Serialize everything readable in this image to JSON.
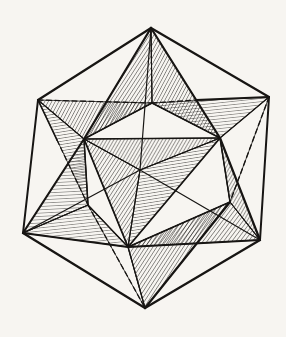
{
  "figure": {
    "name": "stella-octangula-in-cube",
    "canvas": {
      "width": 286,
      "height": 337,
      "background": "#f7f5f1",
      "ink": "#171513"
    },
    "points": {
      "T": [
        151,
        28
      ],
      "UL": [
        38,
        100
      ],
      "UR": [
        269,
        97
      ],
      "L": [
        23,
        233
      ],
      "R": [
        260,
        240
      ],
      "B": [
        145,
        308
      ],
      "F": [
        140,
        170
      ],
      "OT": [
        152,
        103
      ],
      "ONW": [
        84,
        139
      ],
      "ONE": [
        220,
        138
      ],
      "OSW": [
        88,
        205
      ],
      "OSE": [
        230,
        202
      ],
      "OS": [
        128,
        247
      ],
      "RT1": [
        196,
        100
      ],
      "RS1": [
        57,
        140
      ]
    },
    "hatches": [
      {
        "id": "steepA",
        "angle": -57,
        "gap": 3.2,
        "stroke": 0.85
      },
      {
        "id": "steepB",
        "angle": -62,
        "gap": 3.1,
        "stroke": 0.85
      },
      {
        "id": "steepC",
        "angle": -53,
        "gap": 3.3,
        "stroke": 0.85
      },
      {
        "id": "steepD",
        "angle": -60,
        "gap": 3.0,
        "stroke": 0.85
      },
      {
        "id": "horizA",
        "angle": -6,
        "gap": 3.2,
        "stroke": 0.8
      },
      {
        "id": "horizB",
        "angle": -9,
        "gap": 3.1,
        "stroke": 0.8
      },
      {
        "id": "horizC",
        "angle": -3,
        "gap": 3.3,
        "stroke": 0.8
      }
    ],
    "facets": [
      {
        "name": "star-point-ul-upper-face",
        "pts": [
          "UL",
          "OT",
          "ONW"
        ],
        "fill": "steepB"
      },
      {
        "name": "star-point-ul-lower-face",
        "pts": [
          "UL",
          "ONW",
          "OSW"
        ],
        "fill": "horizB"
      },
      {
        "name": "star-point-ur-upper-face",
        "pts": [
          "UR",
          "OT",
          "ONE"
        ],
        "fill": "horizA"
      },
      {
        "name": "star-point-ur-lower-face",
        "pts": [
          "UR",
          "ONE",
          "OSE"
        ],
        "fill": "white"
      },
      {
        "name": "star-point-b-left-face",
        "pts": [
          "B",
          "OSW",
          "OS"
        ],
        "fill": "white"
      },
      {
        "name": "star-point-b-right-face",
        "pts": [
          "B",
          "OS",
          "OSE"
        ],
        "fill": "steepA"
      },
      {
        "name": "star-point-t-left-face",
        "pts": [
          "T",
          "ONW",
          "OT"
        ],
        "fill": "steepA"
      },
      {
        "name": "star-point-t-right-face",
        "pts": [
          "T",
          "OT",
          "ONE"
        ],
        "fill": "steepB"
      },
      {
        "name": "star-point-l-upper-face",
        "pts": [
          "L",
          "ONW",
          "OSW"
        ],
        "fill": "horizC"
      },
      {
        "name": "star-point-l-lower-face",
        "pts": [
          "L",
          "OSW",
          "OS"
        ],
        "fill": "horizA"
      },
      {
        "name": "star-point-r-upper-face",
        "pts": [
          "R",
          "ONE",
          "OSE"
        ],
        "fill": "steepD"
      },
      {
        "name": "star-point-r-lower-face",
        "pts": [
          "R",
          "OSE",
          "OS"
        ],
        "fill": "steepC"
      },
      {
        "name": "star-point-f-top-face",
        "pts": [
          "F",
          "ONW",
          "ONE"
        ],
        "fill": "steepD"
      },
      {
        "name": "star-point-f-left-face",
        "pts": [
          "F",
          "ONW",
          "OS"
        ],
        "fill": "steepA"
      },
      {
        "name": "star-point-f-right-face",
        "pts": [
          "F",
          "ONE",
          "OS"
        ],
        "fill": "horizB"
      }
    ],
    "edges": [
      {
        "name": "cube-edge-top-upperleft",
        "from": "T",
        "to": "UL",
        "w": 2.2
      },
      {
        "name": "cube-edge-top-upperright",
        "from": "T",
        "to": "UR",
        "w": 2.2
      },
      {
        "name": "cube-edge-upperleft-left",
        "from": "UL",
        "to": "L",
        "w": 2.0
      },
      {
        "name": "cube-edge-upperright-right",
        "from": "UR",
        "to": "R",
        "w": 2.0
      },
      {
        "name": "cube-edge-left-bottom",
        "from": "L",
        "to": "B",
        "w": 2.3
      },
      {
        "name": "cube-edge-right-bottom",
        "from": "R",
        "to": "B",
        "w": 2.3
      },
      {
        "name": "tetra-edge-t-onw",
        "from": "T",
        "to": "ONW",
        "w": 2.2
      },
      {
        "name": "tetra-edge-onw-l",
        "from": "ONW",
        "to": "L",
        "w": 2.1
      },
      {
        "name": "tetra-edge-t-one",
        "from": "T",
        "to": "ONE",
        "w": 2.2
      },
      {
        "name": "tetra-edge-one-r",
        "from": "ONE",
        "to": "R",
        "w": 2.2
      },
      {
        "name": "tetra-edge-l-os",
        "from": "L",
        "to": "OS",
        "w": 2.2
      },
      {
        "name": "tetra-edge-os-r",
        "from": "OS",
        "to": "R",
        "w": 2.2
      },
      {
        "name": "tetra-edge-ose-b",
        "from": "OSE",
        "to": "B",
        "w": 2.2
      },
      {
        "name": "tetra-edge-ul-rs1",
        "from": "UL",
        "to": "RS1",
        "w": 1.7
      },
      {
        "name": "tetra-edge-rt1-ur",
        "from": "RT1",
        "to": "UR",
        "w": 1.9
      },
      {
        "name": "octa-edge-ot-onw",
        "from": "OT",
        "to": "ONW",
        "w": 1.5
      },
      {
        "name": "octa-edge-ot-one",
        "from": "OT",
        "to": "ONE",
        "w": 1.5
      },
      {
        "name": "octa-edge-onw-one",
        "from": "ONW",
        "to": "ONE",
        "w": 1.7
      },
      {
        "name": "octa-edge-onw-osw",
        "from": "ONW",
        "to": "OSW",
        "w": 1.5
      },
      {
        "name": "octa-edge-one-ose",
        "from": "ONE",
        "to": "OSE",
        "w": 1.5
      },
      {
        "name": "octa-edge-onw-os",
        "from": "ONW",
        "to": "OS",
        "w": 1.8
      },
      {
        "name": "octa-edge-one-os",
        "from": "ONE",
        "to": "OS",
        "w": 1.8
      },
      {
        "name": "octa-edge-osw-os",
        "from": "OSW",
        "to": "OS",
        "w": 1.5
      },
      {
        "name": "octa-edge-ose-os",
        "from": "OSE",
        "to": "OS",
        "w": 1.6
      },
      {
        "name": "crease-t-ot",
        "from": "T",
        "to": "OT",
        "w": 1.1
      },
      {
        "name": "crease-ul-onw",
        "from": "UL",
        "to": "ONW",
        "w": 1.1
      },
      {
        "name": "crease-ur-one",
        "from": "UR",
        "to": "ONE",
        "w": 1.3
      },
      {
        "name": "crease-l-osw",
        "from": "L",
        "to": "OSW",
        "w": 1.1
      },
      {
        "name": "crease-r-ose",
        "from": "R",
        "to": "OSE",
        "w": 1.1
      },
      {
        "name": "crease-b-os",
        "from": "B",
        "to": "OS",
        "w": 1.3
      },
      {
        "name": "crease-f-onw",
        "from": "F",
        "to": "ONW",
        "w": 1.1
      },
      {
        "name": "crease-f-one",
        "from": "F",
        "to": "ONE",
        "w": 1.3
      },
      {
        "name": "crease-f-os",
        "from": "F",
        "to": "OS",
        "w": 1.1
      },
      {
        "name": "cube-edge-front-top",
        "from": "F",
        "to": "T",
        "w": 1.2
      },
      {
        "name": "cube-edge-front-left",
        "from": "F",
        "to": "L",
        "w": 1.2
      },
      {
        "name": "cube-edge-front-right",
        "from": "F",
        "to": "R",
        "w": 1.2
      },
      {
        "name": "hidden-edge-ul-ot",
        "from": "UL",
        "to": "OT",
        "w": 1.3,
        "dash": "5 3.5"
      },
      {
        "name": "hidden-edge-ot-rt1",
        "from": "OT",
        "to": "RT1",
        "w": 1.3,
        "dash": "5 3.5"
      },
      {
        "name": "hidden-edge-rs1-osw",
        "from": "RS1",
        "to": "OSW",
        "w": 1.3,
        "dash": "5 3.5"
      },
      {
        "name": "hidden-edge-osw-b",
        "from": "OSW",
        "to": "B",
        "w": 1.3,
        "dash": "5 3.5"
      },
      {
        "name": "hidden-edge-ur-ose",
        "from": "UR",
        "to": "OSE",
        "w": 1.4,
        "dash": "5 3.5"
      }
    ]
  }
}
